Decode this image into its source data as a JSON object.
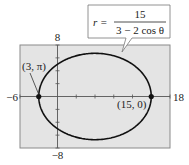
{
  "chart_data": {
    "type": "line",
    "title": "",
    "equation": {
      "lhs": "r =",
      "numerator": "15",
      "denominator": "3 − 2 cos θ"
    },
    "polar_function": {
      "numerator": 15,
      "a": 3,
      "b": -2
    },
    "xlim": [
      -6,
      18
    ],
    "ylim": [
      -8,
      8
    ],
    "x_tick_step": 3,
    "y_tick_step": 2,
    "tick_labels": {
      "xmin": "−6",
      "xmax": "18",
      "ymax": "8",
      "ymin": "−8"
    },
    "grid": false,
    "points": [
      {
        "label": "(3, π)",
        "x": -3,
        "y": 0
      },
      {
        "label": "(15, 0)",
        "x": 15,
        "y": 0
      }
    ]
  },
  "colors": {
    "plot_bg": "#e4e4e4",
    "curve": "#111111",
    "axis": "#555555",
    "frame": "#8a8a8a"
  }
}
